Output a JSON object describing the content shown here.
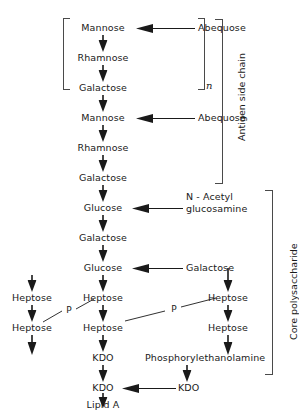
{
  "diagram": {
    "region_labels": {
      "antigen_side_chain": "Antigen side chain",
      "core_polysaccharide": "Core polysaccharide",
      "repeat_subscript": "n"
    },
    "phosphate_label": "P",
    "nodes": {
      "mannose_1": "Mannose",
      "abequose_1": "Abequose",
      "rhamnose_1": "Rhamnose",
      "galactose_1": "Galactose",
      "mannose_2": "Mannose",
      "abequose_2": "Abequose",
      "rhamnose_2": "Rhamnose",
      "galactose_2": "Galactose",
      "glucose_1": "Glucose",
      "n_acetyl_line1": "N - Acetyl",
      "n_acetyl_line2": "glucosamine",
      "galactose_3": "Galactose",
      "glucose_2": "Glucose",
      "galactose_branch": "Galactose",
      "heptose_left_1": "Heptose",
      "heptose_left_2": "Heptose",
      "heptose_mid_1": "Heptose",
      "heptose_mid_2": "Heptose",
      "heptose_right_1": "Heptose",
      "heptose_right_2": "Heptose",
      "kdo_1": "KDO",
      "kdo_2": "KDO",
      "kdo_branch": "KDO",
      "phosphorylethanolamine": "Phosphorylethanolamine",
      "lipid_a": "Lipid A",
      "p_left": "P",
      "p_right": "P"
    },
    "colors": {
      "ink": "#1a1a1a",
      "bracket": "#4a4a4a",
      "background": "#ffffff"
    }
  }
}
